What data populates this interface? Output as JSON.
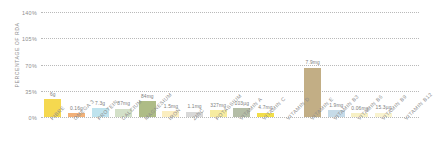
{
  "chart_data": {
    "type": "bar",
    "title": "",
    "xlabel": "",
    "ylabel": "PERCENTAGE OF RDA",
    "ylim": [
      0,
      140
    ],
    "ytick_labels": [
      "140%",
      "105%",
      "70%",
      "35%",
      "0%"
    ],
    "ytick_values": [
      140,
      105,
      70,
      35,
      0
    ],
    "grid": "horizontal-dotted",
    "legend": "none",
    "categories": [
      "FIBRE",
      "OMEGA 3",
      "PROTEIN",
      "CALCIUM",
      "MAGNESIUM",
      "IRON",
      "ZINC",
      "POTASSIUM",
      "VITAMIN A",
      "VITAMIN C",
      "VITAMIN D",
      "VITAMIN E",
      "VITAMIN B3",
      "VITAMIN B6",
      "VITAMIN B9",
      "VITAMIN B12"
    ],
    "values": [
      24,
      5,
      12,
      11,
      21,
      8,
      7,
      9,
      12,
      6,
      0,
      66,
      9,
      5,
      6,
      0
    ],
    "data_labels": [
      "6g",
      "0.16g",
      "7.3g",
      "87mg",
      "84mg",
      "1.5mg",
      "1.1mg",
      "327mg",
      "103µg",
      "4.7mg",
      "",
      "7.9mg",
      "1.9mg",
      "0.06mg",
      "15.3µg",
      ""
    ],
    "colors": [
      "#f5d84f",
      "#f2b178",
      "#bfe3ee",
      "#d3e0c8",
      "#aebc86",
      "#fbeec0",
      "#d8d8d8",
      "#f7eca0",
      "#b4bda6",
      "#f2de4a",
      "#ffffff",
      "#c2ae85",
      "#c6dbe8",
      "#f7f0c4",
      "#f9f3cf",
      "#ffffff"
    ]
  }
}
